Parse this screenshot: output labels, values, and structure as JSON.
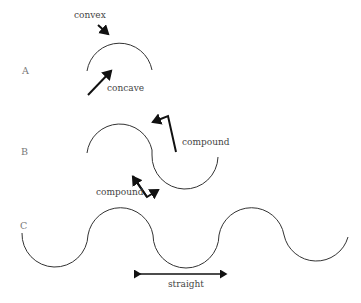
{
  "diagram": {
    "rows": [
      {
        "id": "A",
        "label": "A",
        "annotations": [
          "convex",
          "concave"
        ]
      },
      {
        "id": "B",
        "label": "B",
        "annotations": [
          "compound",
          "compound"
        ]
      },
      {
        "id": "C",
        "label": "C",
        "annotations": [
          "straight"
        ]
      }
    ],
    "labels": {
      "row_a": "A",
      "row_b": "B",
      "row_c": "C",
      "convex": "convex",
      "concave": "concave",
      "compound_upper": "compound",
      "compound_lower": "compound",
      "straight": "straight"
    },
    "colors": {
      "curve": "#333333",
      "arrow": "#111111",
      "text": "#555555"
    }
  }
}
